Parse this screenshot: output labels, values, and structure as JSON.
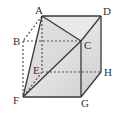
{
  "diagram": {
    "colors": {
      "edge": "#3a3a3a",
      "hidden_edge": "#555555",
      "face_light": "#eeeeee",
      "face_mid": "#dcdcdc",
      "face_dark": "#c8c8c8"
    },
    "vertices": {
      "A": "A",
      "B": "B",
      "C": "C",
      "D": "D",
      "E": "E",
      "F": "F",
      "G": "G",
      "H": "H"
    },
    "visible_edges": [
      "A-D",
      "A-C",
      "D-C",
      "C-F",
      "D-H",
      "C-G",
      "G-H",
      "F-G",
      "A-F"
    ],
    "hidden_edges": [
      "A-B",
      "B-C",
      "B-F",
      "A-E",
      "E-H",
      "E-F"
    ]
  }
}
